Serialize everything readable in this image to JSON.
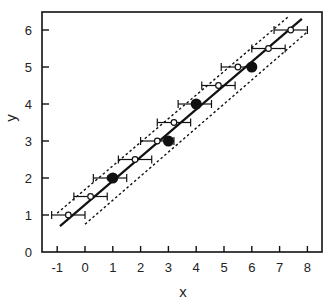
{
  "chart_data": {
    "type": "scatter",
    "title": "",
    "xlabel": "x",
    "ylabel": "y",
    "xlim": [
      -1.5,
      8.7
    ],
    "ylim": [
      0,
      6.5
    ],
    "xticks": [
      -1,
      0,
      1,
      2,
      3,
      4,
      5,
      6,
      7,
      8
    ],
    "yticks": [
      0,
      1,
      2,
      3,
      4,
      5,
      6
    ],
    "grid": false,
    "legend": null,
    "series": [
      {
        "name": "observed points",
        "marker": "large-filled-circle",
        "x": [
          1,
          3,
          4,
          6
        ],
        "y": [
          2,
          3,
          4,
          5
        ]
      },
      {
        "name": "fitted points with x error bars",
        "marker": "small-open-circle",
        "x": [
          -0.6,
          0.2,
          0.9,
          1.8,
          2.6,
          3.2,
          3.95,
          4.8,
          5.5,
          6.6,
          7.4
        ],
        "y": [
          1.0,
          1.5,
          2.0,
          2.5,
          3.0,
          3.5,
          4.0,
          4.5,
          5.0,
          5.5,
          6.0
        ],
        "x_error": 0.6
      },
      {
        "name": "regression line",
        "style": "solid",
        "x": [
          -0.9,
          7.8
        ],
        "y": [
          0.7,
          6.3
        ]
      },
      {
        "name": "upper confidence band",
        "style": "dotted",
        "x": [
          -1.0,
          7.3
        ],
        "y": [
          1.05,
          6.35
        ]
      },
      {
        "name": "lower confidence band",
        "style": "dotted",
        "x": [
          0.0,
          8.0
        ],
        "y": [
          0.75,
          5.95
        ]
      }
    ]
  },
  "axes": {
    "x_label": "x",
    "y_label": "y",
    "x_tick_labels": [
      "-1",
      "0",
      "1",
      "2",
      "3",
      "4",
      "5",
      "6",
      "7",
      "8"
    ],
    "y_tick_labels": [
      "0",
      "1",
      "2",
      "3",
      "4",
      "5",
      "6"
    ]
  },
  "colors": {
    "ink": "#111111",
    "background": "#ffffff"
  }
}
